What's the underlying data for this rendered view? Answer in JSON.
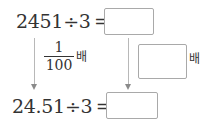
{
  "top_equation": {
    "expression": "2451÷3 =",
    "answer_value": ""
  },
  "left_transform": {
    "fraction_numerator": "1",
    "fraction_denominator": "100",
    "suffix": "배"
  },
  "right_transform": {
    "answer_value": "",
    "suffix": "배"
  },
  "bottom_equation": {
    "expression": "24.51÷3 =",
    "answer_value": ""
  },
  "colors": {
    "text": "#333333",
    "box_border": "#a9a9a9",
    "arrow": "#b8b8b8"
  }
}
